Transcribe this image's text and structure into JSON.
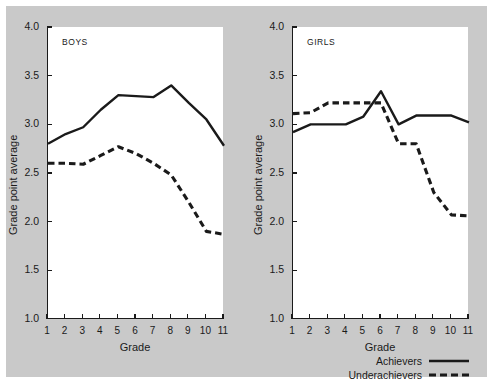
{
  "figure": {
    "background_color": "#c9c9c9",
    "panel_color": "#ffffff",
    "ink_color": "#1a1a1a"
  },
  "axes": {
    "xlabel": "Grade",
    "ylabel": "Grade point average",
    "xticks": [
      "1",
      "2",
      "3",
      "4",
      "5",
      "6",
      "7",
      "8",
      "9",
      "10",
      "11"
    ],
    "yticks": [
      "1.0",
      "1.5",
      "2.0",
      "2.5",
      "3.0",
      "3.5",
      "4.0"
    ]
  },
  "panels": {
    "boys": {
      "title": "BOYS"
    },
    "girls": {
      "title": "GIRLS"
    }
  },
  "legend": {
    "position": "bottom-right",
    "items": [
      {
        "label": "Achievers",
        "style": "solid"
      },
      {
        "label": "Underachievers",
        "style": "dashed"
      }
    ]
  },
  "chart_data": [
    {
      "type": "line",
      "title": "BOYS",
      "xlabel": "Grade",
      "ylabel": "Grade point average",
      "x": [
        1,
        2,
        3,
        4,
        5,
        6,
        7,
        8,
        9,
        10,
        11
      ],
      "xlim": [
        1,
        11
      ],
      "ylim": [
        1.0,
        4.0
      ],
      "grid": false,
      "legend_position": "bottom-right",
      "series": [
        {
          "name": "Achievers",
          "style": "solid",
          "values": [
            2.8,
            2.9,
            2.97,
            3.15,
            3.3,
            3.29,
            3.28,
            3.4,
            3.22,
            3.05,
            2.78
          ]
        },
        {
          "name": "Underachievers",
          "style": "dashed",
          "values": [
            2.6,
            2.6,
            2.59,
            2.68,
            2.77,
            2.7,
            2.6,
            2.48,
            2.2,
            1.9,
            1.87
          ]
        }
      ]
    },
    {
      "type": "line",
      "title": "GIRLS",
      "xlabel": "Grade",
      "ylabel": "Grade point average",
      "x": [
        1,
        2,
        3,
        4,
        5,
        6,
        7,
        8,
        9,
        10,
        11
      ],
      "xlim": [
        1,
        11
      ],
      "ylim": [
        1.0,
        4.0
      ],
      "grid": false,
      "legend_position": "bottom-right",
      "series": [
        {
          "name": "Achievers",
          "style": "solid",
          "values": [
            2.92,
            3.0,
            3.0,
            3.0,
            3.08,
            3.34,
            3.0,
            3.09,
            3.09,
            3.09,
            3.02
          ]
        },
        {
          "name": "Underachievers",
          "style": "dashed",
          "values": [
            3.11,
            3.12,
            3.22,
            3.22,
            3.22,
            3.22,
            2.8,
            2.8,
            2.3,
            2.07,
            2.06
          ]
        }
      ]
    }
  ]
}
